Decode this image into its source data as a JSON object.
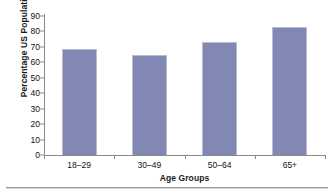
{
  "chart_data": {
    "type": "bar",
    "title": "",
    "xlabel": "Age Groups",
    "ylabel": "Percentage US Population",
    "categories": [
      "18–29",
      "30–49",
      "50–64",
      "65+"
    ],
    "values": [
      68.5,
      65,
      73,
      83
    ],
    "ylim": [
      0,
      90
    ],
    "ytick_labels": [
      "90",
      "80",
      "70",
      "60",
      "50",
      "40",
      "30",
      "20",
      "10",
      "0"
    ],
    "ytick_values": [
      90,
      80,
      70,
      60,
      50,
      40,
      30,
      20,
      10,
      0
    ],
    "ystep": 10,
    "grid": false,
    "legend": false,
    "series": [
      {
        "name": "Percentage US Population",
        "values": [
          68.5,
          65,
          73,
          83
        ],
        "color": "#8288b4"
      }
    ],
    "colors": {
      "bar_fill": "#8288b4",
      "bar_edge": "#b9bcd4",
      "axis": "#8a8a8a",
      "text": "#111111",
      "background": "#ffffff"
    }
  }
}
